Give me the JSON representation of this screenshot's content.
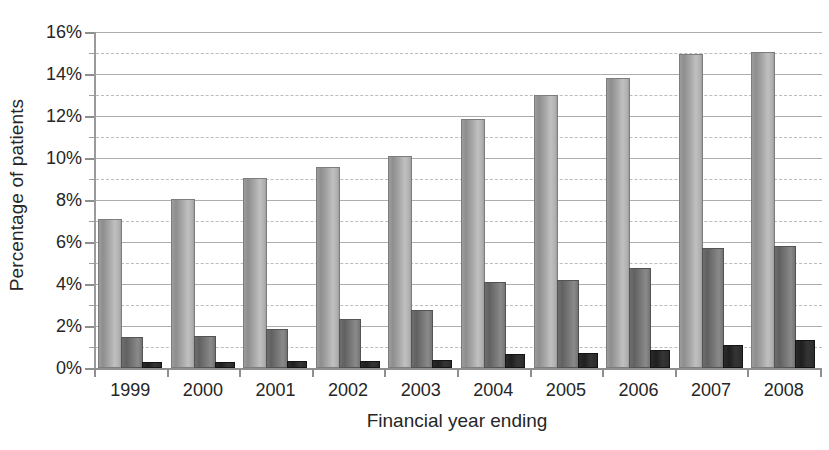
{
  "chart_data": {
    "type": "bar",
    "title": "",
    "xlabel": "Financial year ending",
    "ylabel": "Percentage of patients",
    "categories": [
      "1999",
      "2000",
      "2001",
      "2002",
      "2003",
      "2004",
      "2005",
      "2006",
      "2007",
      "2008"
    ],
    "ylim": [
      0,
      16
    ],
    "y_unit": "%",
    "y_ticks": [
      0,
      2,
      4,
      6,
      8,
      10,
      12,
      14,
      16
    ],
    "y_tick_labels": [
      "0%",
      "2%",
      "4%",
      "6%",
      "8%",
      "10%",
      "12%",
      "14%",
      "16%"
    ],
    "y_minor_ticks": [
      1,
      3,
      5,
      7,
      9,
      11,
      13,
      15
    ],
    "grid": {
      "major_horizontal": true,
      "minor_horizontal": true,
      "major_style": "solid",
      "minor_style": "dashed",
      "vertical": false
    },
    "legend": {
      "visible": false,
      "position": "none"
    },
    "series": [
      {
        "name": "series-1",
        "color": "#a8a8a8",
        "values": [
          7.0,
          7.95,
          8.95,
          9.5,
          10.0,
          11.75,
          12.9,
          13.7,
          14.85,
          14.95
        ]
      },
      {
        "name": "series-2",
        "color": "#6e6e6e",
        "values": [
          1.4,
          1.45,
          1.75,
          2.25,
          2.65,
          4.0,
          4.1,
          4.65,
          5.6,
          5.7
        ]
      },
      {
        "name": "series-3",
        "color": "#262626",
        "values": [
          0.2,
          0.2,
          0.22,
          0.25,
          0.28,
          0.55,
          0.6,
          0.75,
          1.0,
          1.25
        ]
      }
    ]
  }
}
